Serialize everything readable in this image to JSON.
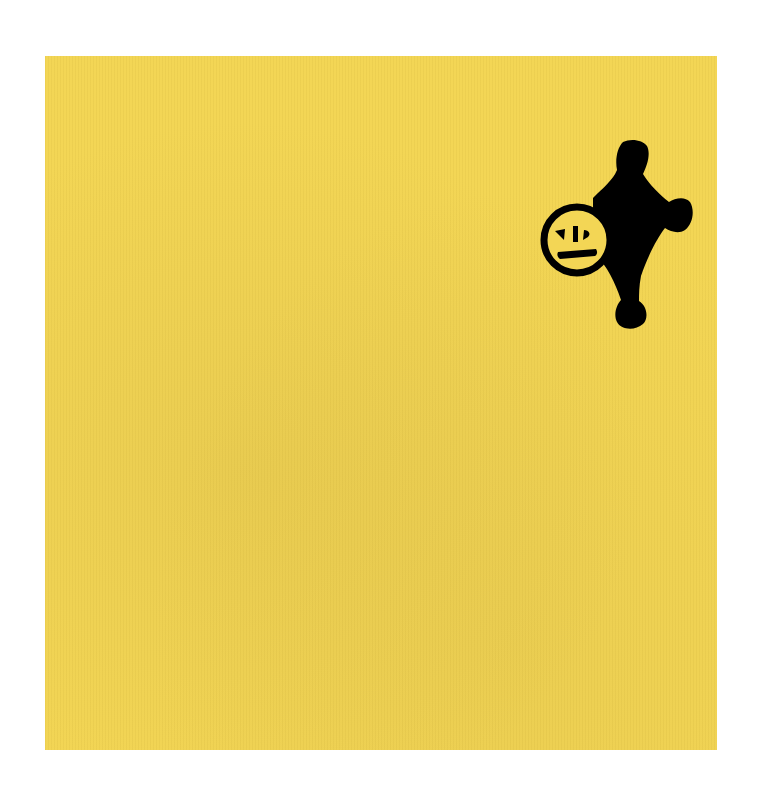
{
  "artwork": {
    "background_color": "#ffffff",
    "panel_color": "#f3d655",
    "figure_color": "#000000",
    "figure": {
      "description": "Black hand-drawn cross/star-like shape with rounded lobes (top, right, bottom) and a circle containing a simple face on the left",
      "face": {
        "eyes": 2,
        "nose": "vertical line",
        "mouth": "horizontal line"
      }
    }
  }
}
